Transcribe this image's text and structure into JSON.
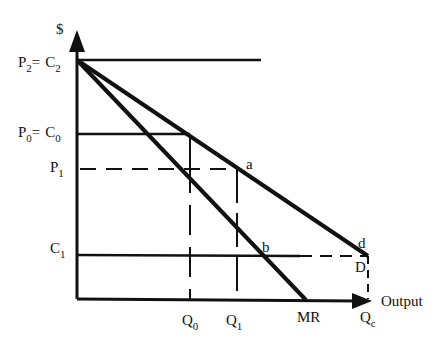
{
  "diagram": {
    "type": "monopoly_pricing_diagram",
    "y_axis_label": "$",
    "x_axis_label": "Output",
    "price_cost_levels": [
      {
        "id": "p2c2",
        "left": "P",
        "left_sub": "2",
        "eq": "=",
        "right": "C",
        "right_sub": "2"
      },
      {
        "id": "p0c0",
        "left": "P",
        "left_sub": "0",
        "eq": "=",
        "right": "C",
        "right_sub": "0"
      },
      {
        "id": "p1",
        "left": "P",
        "left_sub": "1"
      },
      {
        "id": "c1",
        "left": "C",
        "left_sub": "1"
      }
    ],
    "quantity_labels": [
      {
        "id": "q0",
        "main": "Q",
        "sub": "0"
      },
      {
        "id": "q1",
        "main": "Q",
        "sub": "1"
      },
      {
        "id": "mr",
        "main": "MR",
        "sub": ""
      },
      {
        "id": "qc",
        "main": "Q",
        "sub": "c"
      }
    ],
    "point_labels": {
      "a": "a",
      "b": "b",
      "d": "d",
      "D": "D"
    },
    "curves": [
      "Demand (D)",
      "Marginal Revenue (MR)"
    ]
  }
}
